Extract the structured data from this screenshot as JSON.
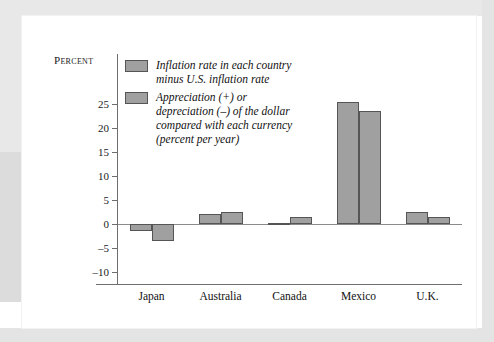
{
  "chart_data": {
    "type": "bar",
    "title": "",
    "xlabel": "",
    "ylabel": "Percent",
    "ylim": [
      -10,
      27
    ],
    "yticks": [
      25,
      20,
      15,
      10,
      5,
      0,
      -5,
      -10
    ],
    "ytick_labels": [
      "25",
      "20",
      "15",
      "10",
      "5",
      "0",
      "–5",
      "–10"
    ],
    "grid": false,
    "legend_position": "upper-left-inside",
    "categories": [
      "Japan",
      "Australia",
      "Canada",
      "Mexico",
      "U.K."
    ],
    "series": [
      {
        "name": "Inflation rate in each country minus U.S. inflation rate",
        "color": "#a0a0a0",
        "values": [
          -1.5,
          2.0,
          0.2,
          25.5,
          2.5
        ]
      },
      {
        "name": "Appreciation (+) or depreciation (–) of the dollar compared with each currency (percent per year)",
        "color": "#a0a0a0",
        "values": [
          -3.6,
          2.6,
          1.5,
          23.5,
          1.5
        ]
      }
    ],
    "legend_entries": [
      {
        "swatch_color": "#a0a0a0",
        "lines": [
          "Inflation rate in each country",
          "minus U.S. inflation rate"
        ]
      },
      {
        "swatch_color": "#a0a0a0",
        "lines": [
          "Appreciation (+) or",
          "depreciation (–) of the dollar",
          "compared with each currency",
          "(percent per year)"
        ]
      }
    ]
  },
  "colors": {
    "bar_fill": "#a0a0a0",
    "bar_stroke": "#555555",
    "axis": "#6e6e6e",
    "text": "#111111",
    "matte": "#e4e4e4",
    "card": "#ffffff"
  }
}
